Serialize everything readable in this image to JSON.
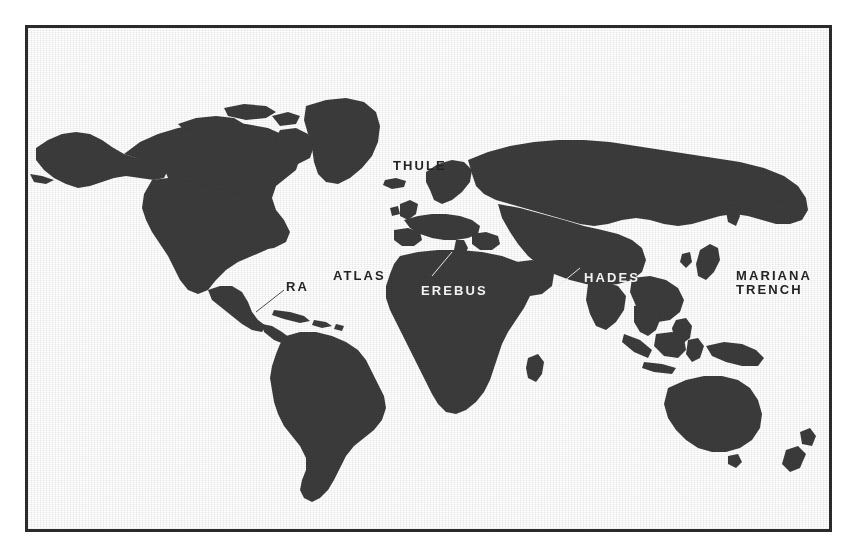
{
  "map": {
    "title": "World Map",
    "projection": "equirectangular",
    "land_color": "#3c3c3c",
    "ocean_color": "#ffffff",
    "border_color": "#2b2b2b",
    "label_ocean_color": "#242424",
    "label_land_color": "#f2f2f2",
    "labels": [
      {
        "id": "thule",
        "text": "THULE",
        "style": "on-ocean",
        "x": 365,
        "y": 131,
        "leader": false
      },
      {
        "id": "atlas",
        "text": "ATLAS",
        "style": "on-ocean",
        "x": 330,
        "y": 241,
        "leader": false
      },
      {
        "id": "erebus",
        "text": "EREBUS",
        "style": "on-land",
        "x": 418,
        "y": 256,
        "leader": true
      },
      {
        "id": "ra",
        "text": "RA",
        "style": "on-ocean",
        "x": 283,
        "y": 281,
        "leader": true
      },
      {
        "id": "hades",
        "text": "HADES",
        "style": "on-land",
        "x": 581,
        "y": 243,
        "leader": true
      },
      {
        "id": "mariana-trench",
        "text": "MARIANA\nTRENCH",
        "style": "on-ocean",
        "x": 733,
        "y": 241,
        "leader": false
      }
    ]
  }
}
